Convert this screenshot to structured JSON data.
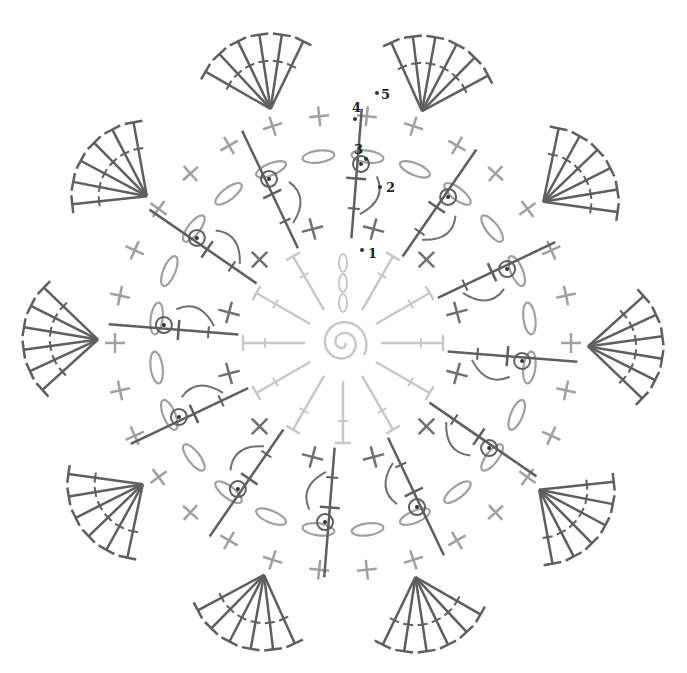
{
  "diagram": {
    "type": "crochet-chart",
    "center": [
      343,
      343
    ],
    "colors": {
      "round1": "#c8c8c8",
      "round2": "#a0a0a0",
      "round3": "#8a8a8a",
      "round4": "#707070",
      "round5": "#5f5f5f",
      "marker": "#333333",
      "label": "#222222"
    },
    "round1": {
      "stitch": "half-double-crochet",
      "count": 12,
      "inner_r": 30,
      "outer_r": 100
    },
    "round2": {
      "stitch": "chain",
      "count": 12
    },
    "round3": {
      "stitch": "single-crochet",
      "count": 24,
      "r": 130
    },
    "round4": {
      "stitch": "double-crochet-with-picot",
      "count": 12,
      "r_start": 105,
      "r_end": 235
    },
    "round5": {
      "stitch": "treble-crochet-shell",
      "count": 10,
      "base_r": 245,
      "fan_r": 310,
      "trebles_per_shell": 6
    },
    "labels": [
      {
        "text": "1",
        "x": 368,
        "y": 247
      },
      {
        "text": "2",
        "x": 386,
        "y": 181
      },
      {
        "text": "3",
        "x": 354,
        "y": 143
      },
      {
        "text": "4",
        "x": 352,
        "y": 101
      },
      {
        "text": "5",
        "x": 381,
        "y": 88
      }
    ],
    "markers": [
      {
        "x": 362,
        "y": 250
      },
      {
        "x": 380,
        "y": 187
      },
      {
        "x": 366,
        "y": 159
      },
      {
        "x": 355,
        "y": 119
      },
      {
        "x": 377,
        "y": 93
      }
    ]
  }
}
